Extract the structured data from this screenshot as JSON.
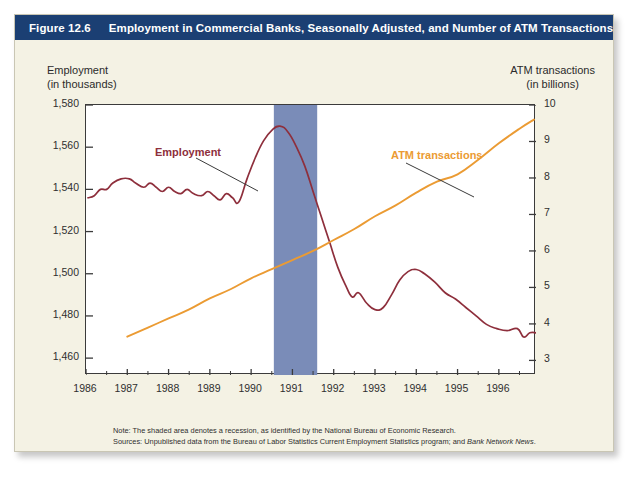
{
  "figure": {
    "number": "Figure 12.6",
    "title": "Employment in Commercial Banks, Seasonally Adjusted, and Number of ATM Transactions, 1986–1996",
    "title_bar_color": "#1b3f73",
    "card_color": "#f4f2e4"
  },
  "axes": {
    "left_title_line1": "Employment",
    "left_title_line2": "(in thousands)",
    "right_title_line1": "ATM transactions",
    "right_title_line2": "(in billions)"
  },
  "labels": {
    "employment": "Employment",
    "atm": "ATM transactions"
  },
  "colors": {
    "employment_line": "#8e2f3c",
    "atm_line": "#eb9b33",
    "recession_band": "#7a8cb8",
    "axis": "#3b3b3b"
  },
  "footnotes": {
    "note": "Note: The shaded area denotes a recession, as identified by the National Bureau of Economic Research.",
    "sources_prefix": "Sources: Unpublished data from the Bureau of Labor Statistics Current Employment Statistics program; and ",
    "sources_italic": "Bank Network News",
    "sources_suffix": "."
  },
  "chart_data": {
    "type": "line",
    "title": "Employment in Commercial Banks, Seasonally Adjusted, and Number of ATM Transactions, 1986–1996",
    "xlabel": "",
    "ylabel": "Employment (in thousands)",
    "y2label": "ATM transactions (in billions)",
    "grid": false,
    "legend": "inline-annotations",
    "xlim": [
      1986.0,
      1996.9
    ],
    "ylim": [
      1452,
      1580
    ],
    "y2lim": [
      2.6,
      10
    ],
    "x_ticks": [
      1986,
      1987,
      1988,
      1989,
      1990,
      1991,
      1992,
      1993,
      1994,
      1995,
      1996
    ],
    "y_ticks": [
      "1,460",
      "1,480",
      "1,500",
      "1,520",
      "1,540",
      "1,560",
      "1,580"
    ],
    "y_tick_values": [
      1460,
      1480,
      1500,
      1520,
      1540,
      1560,
      1580
    ],
    "y2_ticks": [
      "3",
      "4",
      "5",
      "6",
      "7",
      "8",
      "9",
      "10"
    ],
    "y2_tick_values": [
      3,
      4,
      5,
      6,
      7,
      8,
      9,
      10
    ],
    "shaded_regions": [
      {
        "label": "recession",
        "x_start": 1990.55,
        "x_end": 1991.6,
        "color": "#7a8cb8"
      }
    ],
    "series": [
      {
        "name": "Employment",
        "axis": "left",
        "color": "#8e2f3c",
        "units": "thousands",
        "x": [
          1986.05,
          1986.2,
          1986.35,
          1986.5,
          1986.65,
          1986.85,
          1987.05,
          1987.2,
          1987.4,
          1987.55,
          1987.7,
          1987.85,
          1988.0,
          1988.15,
          1988.3,
          1988.45,
          1988.6,
          1988.8,
          1988.95,
          1989.1,
          1989.25,
          1989.4,
          1989.55,
          1989.7,
          1989.9,
          1990.1,
          1990.3,
          1990.5,
          1990.7,
          1990.9,
          1991.1,
          1991.3,
          1991.5,
          1991.7,
          1991.9,
          1992.1,
          1992.3,
          1992.45,
          1992.6,
          1992.8,
          1993.0,
          1993.2,
          1993.4,
          1993.6,
          1993.8,
          1994.0,
          1994.2,
          1994.45,
          1994.7,
          1994.95,
          1995.2,
          1995.45,
          1995.7,
          1995.95,
          1996.2,
          1996.45,
          1996.6,
          1996.75,
          1996.9
        ],
        "y": [
          1536,
          1537,
          1540,
          1540,
          1543,
          1545,
          1545,
          1543,
          1541,
          1543,
          1541,
          1539,
          1541,
          1539,
          1538,
          1540,
          1538,
          1537,
          1539,
          1537,
          1535,
          1538,
          1536,
          1534,
          1545,
          1555,
          1563,
          1568,
          1570,
          1567,
          1560,
          1551,
          1539,
          1527,
          1515,
          1503,
          1494,
          1489,
          1491,
          1486,
          1483,
          1484,
          1490,
          1497,
          1501,
          1502,
          1500,
          1496,
          1491,
          1488,
          1484,
          1480,
          1476,
          1474,
          1473,
          1474,
          1470,
          1472,
          1472
        ]
      },
      {
        "name": "ATM transactions",
        "axis": "right",
        "color": "#eb9b33",
        "units": "billions",
        "x": [
          1987.0,
          1987.5,
          1988.0,
          1988.5,
          1989.0,
          1989.5,
          1990.0,
          1990.5,
          1991.0,
          1991.5,
          1992.0,
          1992.5,
          1993.0,
          1993.5,
          1994.0,
          1994.5,
          1995.0,
          1995.5,
          1996.0,
          1996.5,
          1996.85
        ],
        "y": [
          3.65,
          3.9,
          4.15,
          4.4,
          4.7,
          4.95,
          5.25,
          5.5,
          5.75,
          6.0,
          6.3,
          6.6,
          6.95,
          7.25,
          7.6,
          7.9,
          8.1,
          8.5,
          8.95,
          9.35,
          9.6
        ]
      }
    ]
  }
}
